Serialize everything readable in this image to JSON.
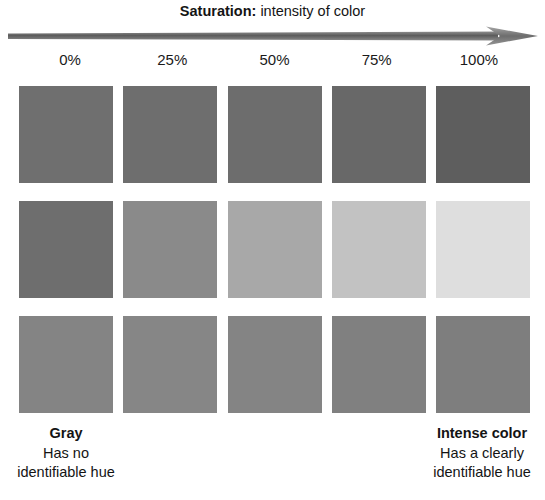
{
  "title": {
    "term": "Saturation:",
    "rest": " intensity of color"
  },
  "axis": {
    "name": "saturation-axis",
    "direction": "left-to-right",
    "color": "#6b6b6b",
    "ticks": [
      "0%",
      "25%",
      "50%",
      "75%",
      "100%"
    ]
  },
  "captions": {
    "left": {
      "title": "Gray",
      "line1": "Has no",
      "line2": "identifiable hue"
    },
    "right": {
      "title": "Intense color",
      "line1": "Has a clearly",
      "line2": "identifiable hue"
    }
  },
  "swatch_grid": {
    "columns": [
      "0%",
      "25%",
      "50%",
      "75%",
      "100%"
    ],
    "rows": [
      {
        "name": "row-1",
        "colors": [
          "#6f6f6f",
          "#6e6e6e",
          "#6d6d6d",
          "#686868",
          "#5e5e5e"
        ]
      },
      {
        "name": "row-2",
        "colors": [
          "#6e6e6e",
          "#8a8a8a",
          "#a8a8a8",
          "#c2c2c2",
          "#dedede"
        ]
      },
      {
        "name": "row-3",
        "colors": [
          "#848484",
          "#868686",
          "#848484",
          "#808080",
          "#7e7e7e"
        ]
      }
    ]
  }
}
